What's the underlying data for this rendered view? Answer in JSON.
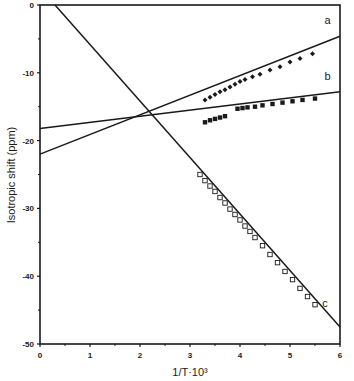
{
  "chart_data": {
    "type": "scatter",
    "title": "",
    "xlabel": "1/T·10³",
    "ylabel": "Isotropic shift (ppm)",
    "xlim": [
      0,
      6
    ],
    "ylim": [
      -50,
      0
    ],
    "x_ticks": [
      0,
      1,
      2,
      3,
      4,
      5,
      6
    ],
    "y_ticks": [
      0,
      -10,
      -20,
      -30,
      -40,
      -50
    ],
    "x_tick_labels": [
      "0",
      "1",
      "2",
      "3",
      "4",
      "5",
      "6"
    ],
    "y_tick_labels": [
      "0",
      "-10",
      "-20",
      "-30",
      "-40",
      "-50"
    ],
    "grid": false,
    "legend": "inline labels at right end of each line",
    "series": [
      {
        "name": "a",
        "marker": "filled-diamond",
        "fit_line": {
          "x": [
            0,
            6
          ],
          "y": [
            -22.0,
            -4.6
          ]
        },
        "x": [
          3.3,
          3.4,
          3.5,
          3.6,
          3.7,
          3.8,
          3.9,
          4.0,
          4.1,
          4.25,
          4.4,
          4.6,
          4.8,
          5.0,
          5.2,
          5.45
        ],
        "y": [
          -14.0,
          -13.6,
          -13.2,
          -12.8,
          -12.5,
          -12.1,
          -11.7,
          -11.3,
          -11.0,
          -10.6,
          -10.2,
          -9.6,
          -9.1,
          -8.4,
          -7.9,
          -7.2
        ]
      },
      {
        "name": "b",
        "marker": "filled-square",
        "fit_line": {
          "x": [
            0,
            6
          ],
          "y": [
            -18.2,
            -12.8
          ]
        },
        "x": [
          3.3,
          3.4,
          3.5,
          3.6,
          3.7,
          3.95,
          4.05,
          4.15,
          4.3,
          4.45,
          4.65,
          4.85,
          5.05,
          5.25,
          5.5
        ],
        "y": [
          -17.3,
          -17.0,
          -16.8,
          -16.6,
          -16.4,
          -15.3,
          -15.2,
          -15.1,
          -15.0,
          -14.8,
          -14.6,
          -14.4,
          -14.2,
          -14.0,
          -13.8
        ]
      },
      {
        "name": "c",
        "marker": "open-square",
        "fit_line": {
          "x": [
            0.3,
            6
          ],
          "y": [
            0,
            -47.5
          ]
        },
        "x": [
          3.2,
          3.3,
          3.4,
          3.5,
          3.6,
          3.7,
          3.8,
          3.9,
          4.0,
          4.1,
          4.2,
          4.3,
          4.45,
          4.6,
          4.75,
          4.9,
          5.05,
          5.2,
          5.35,
          5.5
        ],
        "y": [
          -25.0,
          -25.9,
          -26.7,
          -27.5,
          -28.4,
          -29.2,
          -30.1,
          -30.9,
          -31.7,
          -32.6,
          -33.4,
          -34.3,
          -35.5,
          -36.8,
          -38.0,
          -39.3,
          -40.5,
          -41.8,
          -43.0,
          -44.2
        ]
      }
    ],
    "intersection": {
      "x": 2.3,
      "y": -16.3
    }
  }
}
